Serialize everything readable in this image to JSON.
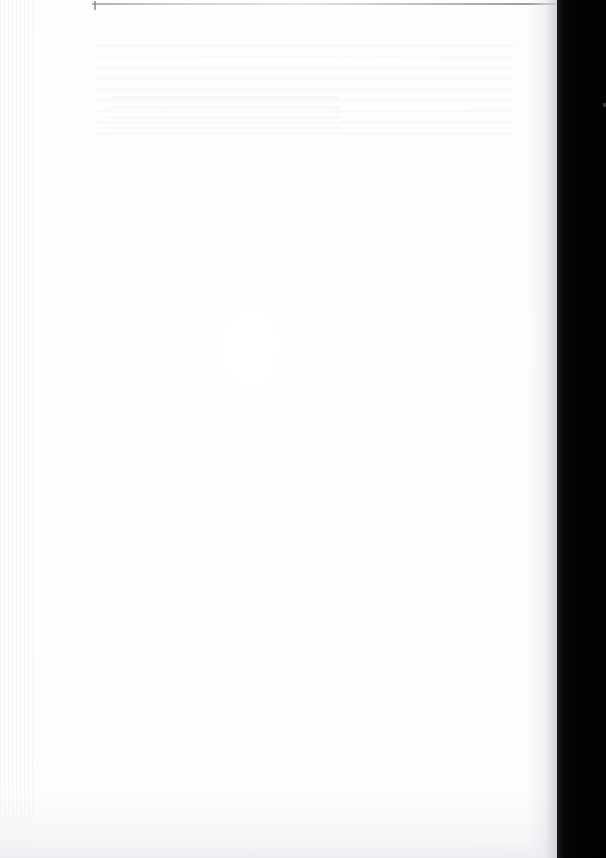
{
  "page": {
    "kind": "scanned-document-page",
    "content_state": "blank",
    "visible_text": "",
    "width_px": 606,
    "height_px": 858
  },
  "sheet": {
    "label": "scanned page sheet",
    "background_color": "#fefefe",
    "paper_tone_color": "#f8f8fa",
    "width_px": 557
  },
  "artifacts": {
    "top_rule": {
      "label": "top edge rule",
      "color": "#8a8a90",
      "left_px": 92,
      "top_px": 3,
      "width_px": 465,
      "height_px": 2
    },
    "top_tick": {
      "label": "edge speck",
      "color": "#87878e"
    },
    "ghost_text": {
      "label": "faint show-through ghosting",
      "color": "#eceef0",
      "legible": "no"
    },
    "scan_banding": {
      "label": "left margin scanner banding",
      "color": "#e4e4e8"
    },
    "bottom_shade": {
      "label": "bottom edge shading",
      "color": "#eeeef2"
    }
  },
  "gutter": {
    "label": "scanner gutter shadow",
    "color": "#000000",
    "left_px": 557,
    "width_px": 49,
    "edge_highlight_color": "#1e1e20"
  }
}
